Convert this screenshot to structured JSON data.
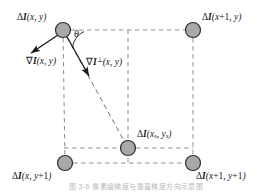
{
  "figure": {
    "type": "pixel-grid-gradient-diagram",
    "caption": "图 3-6  像素级梯度与垂直梯度方向示意图",
    "colors": {
      "node_fill": "#a9a9a9",
      "node_stroke": "#2b2b2b",
      "dashed_line": "#8e8e8e",
      "arrow": "#1a1a1a",
      "text": "#1a1a1a"
    },
    "nodes": [
      {
        "id": "top-left",
        "label_prefix": "ΔI",
        "label_args": "(x, y)",
        "x": 63,
        "y": 30
      },
      {
        "id": "top-right",
        "label_prefix": "ΔI",
        "label_args": "(x+1, y)",
        "x": 193,
        "y": 30
      },
      {
        "id": "bottom-left",
        "label_prefix": "ΔI",
        "label_args": "(x, y+1)",
        "x": 65,
        "y": 163
      },
      {
        "id": "bottom-right",
        "label_prefix": "ΔI",
        "label_args": "(x+1, y+1)",
        "x": 193,
        "y": 163
      },
      {
        "id": "sub-pixel",
        "label_prefix": "ΔI",
        "label_args": "(xs, ys)",
        "x": 128,
        "y": 148
      }
    ],
    "labels": {
      "top_left": {
        "delta": "Δ",
        "italic_I": "I",
        "args": "(x, y)"
      },
      "top_right": {
        "delta": "Δ",
        "italic_I": "I",
        "args_a": "(x",
        "plus": "+1",
        "args_b": ", y)"
      },
      "bottom_left": {
        "delta": "Δ",
        "italic_I": "I",
        "args_a": "(x, y",
        "plus": "+1",
        "args_b": ")"
      },
      "bottom_right": {
        "delta": "Δ",
        "italic_I": "I",
        "args_a": "(x",
        "plus1": "+1",
        "args_b": ", y",
        "plus2": "+1",
        "args_c": ")"
      },
      "sub_pixel": {
        "delta": "Δ",
        "italic_I": "I",
        "open": "(",
        "x": "x",
        "xsub": "s",
        "comma": ", ",
        "y": "y",
        "ysub": "s",
        "close": ")"
      },
      "gradient": {
        "nabla": "∇",
        "italic_I": "I",
        "args": "(x, y)"
      },
      "gradient_perp": {
        "nabla": "∇",
        "italic_I": "I",
        "perp": "⊥",
        "args": "(x, y)"
      },
      "theta": "θ"
    }
  }
}
